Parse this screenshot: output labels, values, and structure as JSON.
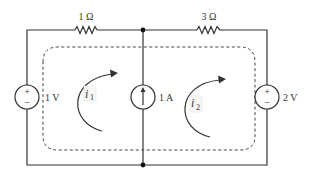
{
  "diagram": {
    "type": "circuit",
    "resistors": [
      {
        "id": "R1",
        "label": "1 Ω",
        "value_ohms": 1,
        "branch": "top-left"
      },
      {
        "id": "R2",
        "label": "3 Ω",
        "value_ohms": 3,
        "branch": "top-right"
      }
    ],
    "sources": [
      {
        "id": "V1",
        "kind": "voltage",
        "label": "1 V",
        "plus": "+",
        "minus": "−",
        "position": "left"
      },
      {
        "id": "I1",
        "kind": "current",
        "label": "1 A",
        "direction": "up",
        "position": "middle"
      },
      {
        "id": "V2",
        "kind": "voltage",
        "label": "2 V",
        "plus": "+",
        "minus": "−",
        "position": "right"
      }
    ],
    "mesh_currents": [
      {
        "symbol": "i",
        "subscript": "1",
        "direction": "clockwise",
        "mesh": "left"
      },
      {
        "symbol": "i",
        "subscript": "2",
        "direction": "clockwise",
        "mesh": "right"
      }
    ],
    "supermesh": {
      "style": "dashed",
      "encloses": [
        "left-mesh",
        "right-mesh"
      ]
    },
    "nodes": [
      "top-middle",
      "bottom-middle"
    ]
  }
}
